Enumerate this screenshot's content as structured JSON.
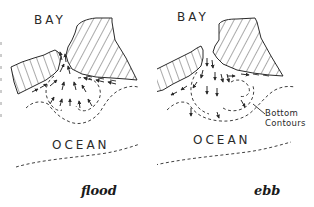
{
  "figure": {
    "colors": {
      "ink": "#2a2a2a",
      "background": "#ffffff"
    },
    "panels": [
      {
        "id": "flood",
        "caption": "flood",
        "labels": {
          "bay": "BAY",
          "ocean": "OCEAN"
        },
        "flow_direction": "landward (into bay)"
      },
      {
        "id": "ebb",
        "caption": "ebb",
        "labels": {
          "bay": "BAY",
          "ocean": "OCEAN"
        },
        "annotation": {
          "line1": "Bottom",
          "line2": "Contours"
        },
        "flow_direction": "seaward (out of bay)"
      }
    ],
    "legend_icons": {
      "land": "hatched-land-icon",
      "contour": "dashed-contour-line",
      "flow": "arrow-icon"
    }
  }
}
